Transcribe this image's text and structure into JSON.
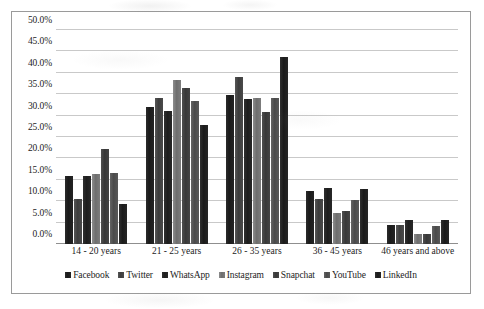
{
  "chart_data": {
    "type": "bar",
    "title": "",
    "subtitle": "",
    "xlabel": "",
    "ylabel": "",
    "grid": true,
    "legend_position": "bottom",
    "ylim": [
      0,
      50
    ],
    "y_ticks": [
      "0.0%",
      "5.0%",
      "10.0%",
      "15.0%",
      "20.0%",
      "25.0%",
      "30.0%",
      "35.0%",
      "40.0%",
      "45.0%",
      "50.0%"
    ],
    "y_tick_values": [
      0,
      5,
      10,
      15,
      20,
      25,
      30,
      35,
      40,
      45,
      50
    ],
    "categories": [
      "14 - 20 years",
      "21 - 25 years",
      "26 - 35 years",
      "36 - 45 years",
      "46 years and above"
    ],
    "series": [
      {
        "name": "Facebook",
        "color": "#1f1f1f",
        "values": [
          16.0,
          32.0,
          34.7,
          12.3,
          4.5
        ]
      },
      {
        "name": "Twitter",
        "color": "#474747",
        "values": [
          10.5,
          34.2,
          39.0,
          10.6,
          4.4
        ]
      },
      {
        "name": "WhatsApp",
        "color": "#242424",
        "values": [
          15.8,
          31.0,
          33.8,
          13.2,
          5.7
        ]
      },
      {
        "name": "Instagram",
        "color": "#7d7d7d",
        "values": [
          16.3,
          38.4,
          34.0,
          7.2,
          2.4
        ]
      },
      {
        "name": "Snapchat",
        "color": "#3f3f3f",
        "values": [
          22.1,
          36.5,
          30.9,
          7.7,
          2.3
        ]
      },
      {
        "name": "YouTube",
        "color": "#555555",
        "values": [
          16.5,
          33.5,
          34.0,
          10.3,
          4.3
        ]
      },
      {
        "name": "LinkedIn",
        "color": "#222222",
        "values": [
          9.3,
          27.8,
          43.7,
          12.9,
          5.5
        ]
      }
    ]
  }
}
